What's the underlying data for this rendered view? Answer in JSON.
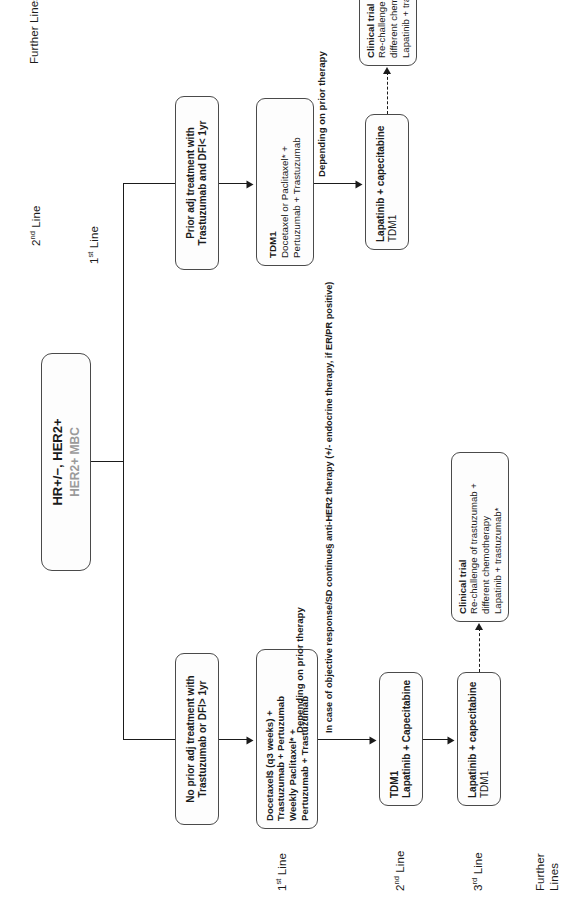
{
  "diagram": {
    "root": {
      "line1": "HR+/−, HER2+",
      "line2": "HER2+ MBC"
    },
    "branch_no_prior": {
      "stage_labels": {
        "first": "1st Line",
        "second": "2nd Line",
        "third": "3rd Line",
        "further_1": "Further",
        "further_2": "Lines"
      },
      "condition": {
        "line1": "No prior adj treatment with",
        "line2": "Trastuzumab or DFI> 1yr"
      },
      "first_line": {
        "line1": "Docetaxel$ (q3 weeks) +",
        "line2": "Trastuzumab + Pertuzumab",
        "line3": "Weekly Paclitaxel* +",
        "line4": "Pertuzumab + Trastuzumab"
      },
      "continuation_note": {
        "line1": "In case of objective response/SD",
        "line2": "continue§ anti-HER2 therapy (+/- endocrine",
        "line3": "therapy, if ER/PR positive)"
      },
      "depending_note": "Depending on prior therapy",
      "second_line": {
        "line1": "TDM1",
        "line2": "Lapatinib + Capecitabine"
      },
      "third_line": {
        "line1": "Lapatinib + capecitabine",
        "line2": "TDM1"
      },
      "further_lines": {
        "line1": "Clinical trial",
        "line2": "Re-challenge of trastuzumab +",
        "line3": "different chemotherapy",
        "line4": "Lapatinib + trastuzumab*"
      }
    },
    "branch_prior": {
      "stage_labels": {
        "first": "1st Line",
        "second": "2nd Line",
        "further": "Further Lines"
      },
      "condition": {
        "line1": "Prior adj treatment with",
        "line2": "Trastuzumab and DFI< 1yr"
      },
      "first_line": {
        "line1": "TDM1",
        "line2": "Docetaxel or Paclitaxel* +",
        "line3": "Pertuzumab + Trastuzumab"
      },
      "depending_note": "Depending on prior therapy",
      "second_line": {
        "line1": "Lapatinib + capecitabine",
        "line2": "TDM1"
      },
      "further_lines": {
        "line1": "Clinical trial",
        "line2": "Re-challenge of trastuzumab +",
        "line3": "different chemotherapy",
        "line4": "Lapatinib + trastuzumab*"
      }
    },
    "superscripts": {
      "first": "st",
      "second": "nd",
      "third": "rd"
    },
    "colors": {
      "stroke": "#4a4a4a",
      "connector": "#1b1b1b",
      "text": "#1b1b1b",
      "muted": "#9a9a9a",
      "background": "#ffffff"
    }
  }
}
